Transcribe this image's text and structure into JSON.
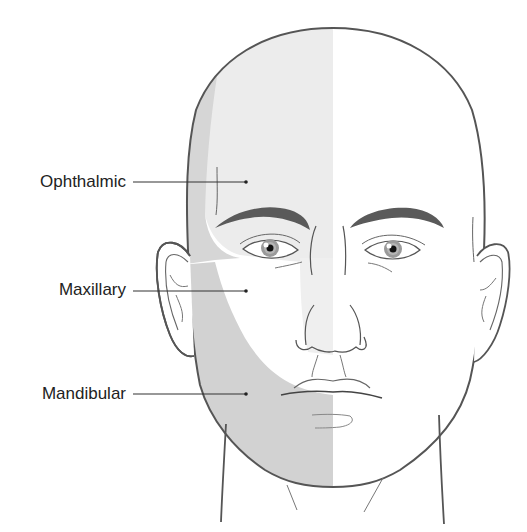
{
  "figure": {
    "labels": [
      {
        "id": "ophthalmic",
        "text": "Ophthalmic"
      },
      {
        "id": "maxillary",
        "text": "Maxillary"
      },
      {
        "id": "mandibular",
        "text": "Mandibular"
      }
    ],
    "colors": {
      "ophthalmic_shade": "#ececec",
      "maxillary_shade": "#f7f7f7",
      "mandibular_shade": "#d2d2d2",
      "outline": "#555555",
      "leader": "#333333",
      "background": "#ffffff"
    }
  }
}
